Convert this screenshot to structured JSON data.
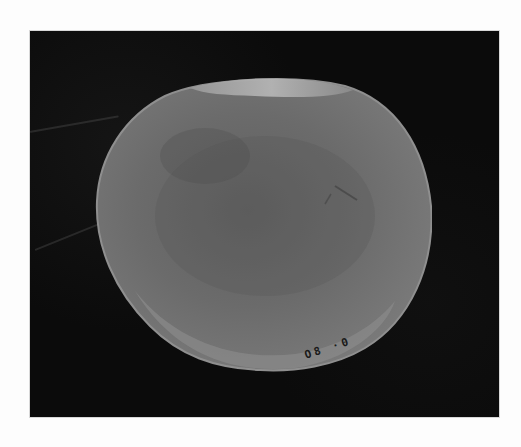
{
  "image": {
    "subject": "Flat round stone artifact photographed on black background",
    "background_color": "#0b0b0b",
    "page_background": "#fdfdfd",
    "stone": {
      "face_color": "#6e6e6e",
      "rim_color": "#a9a9a9",
      "shadow_color": "#4a4a4a"
    },
    "specimen_label": "O8 ·0"
  }
}
